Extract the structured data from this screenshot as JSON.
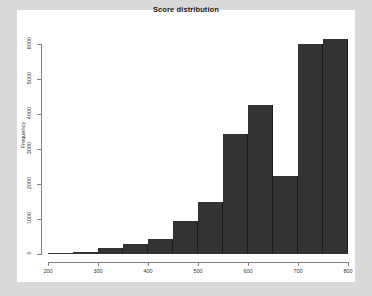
{
  "window": {
    "background_color": "#d9d9d9",
    "panel_color": "#ffffff"
  },
  "chart_data": {
    "type": "bar",
    "title": "Score distribution",
    "xlabel": "",
    "ylabel": "Frequency",
    "grid": false,
    "legend": null,
    "bar_color": "#333333",
    "axis_color": "#808080",
    "xlim": [
      200,
      800
    ],
    "ylim": [
      0,
      6500
    ],
    "xticks": [
      200,
      300,
      400,
      500,
      600,
      700,
      800
    ],
    "yticks": [
      0,
      1000,
      2000,
      3000,
      4000,
      5000,
      6000
    ],
    "bin_width": 50,
    "bin_edges": [
      200,
      250,
      300,
      350,
      400,
      450,
      500,
      550,
      600,
      650,
      700,
      750,
      800
    ],
    "categories": [
      "200-250",
      "250-300",
      "300-350",
      "350-400",
      "400-450",
      "450-500",
      "500-550",
      "550-600",
      "600-650",
      "650-700",
      "700-750",
      "750-800"
    ],
    "values": [
      30,
      70,
      180,
      300,
      430,
      950,
      1500,
      3430,
      4260,
      2230,
      6000,
      6150
    ]
  }
}
